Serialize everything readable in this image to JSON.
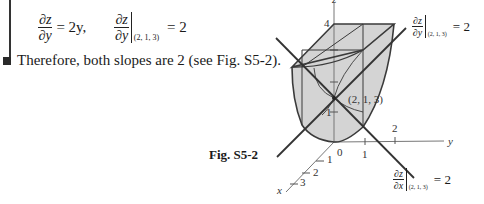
{
  "equation": {
    "lhs_num": "∂z",
    "lhs_den": "∂y",
    "equals1": "= 2y,",
    "eval_num": "∂z",
    "eval_den": "∂y",
    "eval_point": "(2, 1, 3)",
    "equals2": "= 2"
  },
  "conclusion": {
    "text": "Therefore, both slopes are 2 (see Fig. S5-2)."
  },
  "figure": {
    "caption": "Fig. S5-2",
    "axes": {
      "z_label": "z",
      "y_label": "y",
      "x_label": "x",
      "z_tick_4": "4",
      "z_tick_1": "1",
      "origin": "0",
      "y_tick_1": "1",
      "y_tick_2": "2",
      "x_tick_1": "1",
      "x_tick_2": "2",
      "x_tick_3": "3"
    },
    "point_label": "(2, 1, 3)",
    "annotation_y": {
      "num": "∂z",
      "den": "∂y",
      "point": "(2, 1, 3)",
      "equals": "= 2"
    },
    "annotation_x": {
      "num": "∂z",
      "den": "∂x",
      "point": "(2, 1, 3)",
      "equals": "= 2"
    },
    "colors": {
      "surface_fill": "#d4d4d4",
      "line": "#3a3a3a",
      "axis": "#777777"
    }
  }
}
